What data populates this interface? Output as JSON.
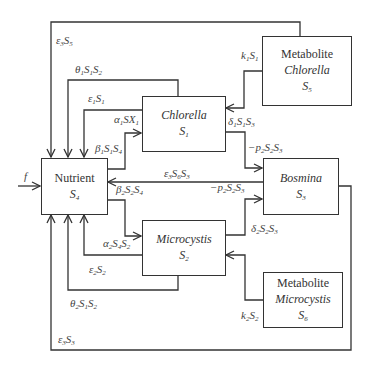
{
  "diagram": {
    "type": "flow-diagram",
    "nodes": {
      "nutrient": {
        "title": "Nutrient",
        "symbol": "S",
        "sub": "4"
      },
      "chlorella": {
        "title": "Chlorella",
        "symbol": "S",
        "sub": "1"
      },
      "microcystis": {
        "title": "Microcystis",
        "symbol": "S",
        "sub": "2"
      },
      "bosmina": {
        "title": "Bosmina",
        "symbol": "S",
        "sub": "3"
      },
      "metabolite_chlorella": {
        "line1": "Metabolite",
        "line2": "Chlorella",
        "symbol": "S",
        "sub": "5"
      },
      "metabolite_microcystis": {
        "line1": "Metabolite",
        "line2": "Microcystis",
        "symbol": "S",
        "sub": "6"
      }
    },
    "edges": {
      "f": "f",
      "eps3S5": {
        "a": "ε",
        "a_sub": "3",
        "b": "S",
        "b_sub": "5"
      },
      "theta1": {
        "a": "θ",
        "a_sub": "1",
        "b": "S",
        "b_sub": "1",
        "c": "S",
        "c_sub": "2"
      },
      "eps1S1": {
        "a": "ε",
        "a_sub": "1",
        "b": "S",
        "b_sub": "1"
      },
      "alpha1": {
        "a": "α",
        "a_sub": "1",
        "b": "SX",
        "b_sub": "1"
      },
      "beta1": {
        "a": "β",
        "a_sub": "1",
        "b": "S",
        "b_sub": "1",
        "c": "S",
        "c_sub": "4"
      },
      "eps3S6S3": {
        "a": "ε",
        "a_sub": "3",
        "b": "S",
        "b_sub": "6",
        "c": "S",
        "c_sub": "3"
      },
      "beta2": {
        "a": "β",
        "a_sub": "2",
        "b": "S",
        "b_sub": "2",
        "c": "S",
        "c_sub": "4"
      },
      "alpha2": {
        "a": "α",
        "a_sub": "2",
        "b": "S",
        "b_sub": "4",
        "c": "S",
        "c_sub": "2"
      },
      "eps2S2": {
        "a": "ε",
        "a_sub": "2",
        "b": "S",
        "b_sub": "2"
      },
      "theta2": {
        "a": "θ",
        "a_sub": "2",
        "b": "S",
        "b_sub": "1",
        "c": "S",
        "c_sub": "2"
      },
      "eps3S3": {
        "a": "ε",
        "a_sub": "3",
        "b": "S",
        "b_sub": "3"
      },
      "k1S1": {
        "a": "k",
        "a_sub": "1",
        "b": "S",
        "b_sub": "1"
      },
      "delta1": {
        "a": "δ",
        "a_sub": "1",
        "b": "S",
        "b_sub": "1",
        "c": "S",
        "c_sub": "3"
      },
      "p2_top": {
        "a": "−p",
        "a_sub": "2",
        "b": "S",
        "b_sub": "2",
        "c": "S",
        "c_sub": "3"
      },
      "p2_mid": {
        "a": "−p",
        "a_sub": "2",
        "b": "S",
        "b_sub": "2",
        "c": "S",
        "c_sub": "3"
      },
      "delta2": {
        "a": "δ",
        "a_sub": "2",
        "b": "S",
        "b_sub": "2",
        "c": "S",
        "c_sub": "3"
      },
      "k2S2": {
        "a": "k",
        "a_sub": "2",
        "b": "S",
        "b_sub": "2"
      }
    }
  }
}
